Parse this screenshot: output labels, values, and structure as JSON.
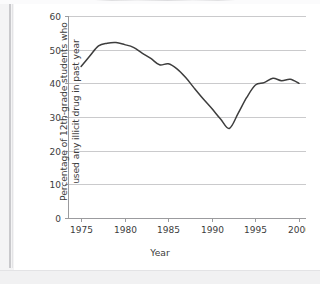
{
  "figure": {
    "kind": "line-chart",
    "background_color": "#ffffff",
    "page_edge_color": "#f4f4f5"
  },
  "axes": {
    "y_title": "Percentage of 12th-grade students who used any illicit drug in past year",
    "x_title": "Year",
    "y_ticks": [
      "0",
      "10",
      "20",
      "30",
      "40",
      "50",
      "60"
    ],
    "x_ticks": [
      "1975",
      "1980",
      "1985",
      "1990",
      "1995",
      "2000"
    ]
  },
  "chart_data": {
    "type": "line",
    "title": "",
    "subtitle": "",
    "xlabel": "Year",
    "ylabel": "Percentage of 12th-grade students who used any illicit drug in past year",
    "xlim": [
      1973.5,
      2000.8
    ],
    "ylim": [
      0,
      60
    ],
    "ytick_values": [
      0,
      10,
      20,
      30,
      40,
      50,
      60
    ],
    "xtick_values": [
      1975,
      1980,
      1985,
      1990,
      1995,
      2000
    ],
    "grid": "horizontal",
    "legend": "none",
    "line_color": "#3d3d3d",
    "line_width": 1.5,
    "markers": "none",
    "series": [
      {
        "name": "Used any illicit drug in past year",
        "x": [
          1975,
          1976,
          1977,
          1978,
          1979,
          1980,
          1981,
          1982,
          1983,
          1984,
          1985,
          1986,
          1987,
          1988,
          1989,
          1990,
          1991,
          1992,
          1993,
          1994,
          1995,
          1996,
          1997,
          1998,
          1999,
          2000
        ],
        "values": [
          45.0,
          48.1,
          51.1,
          51.9,
          52.1,
          51.5,
          50.7,
          49.0,
          47.4,
          45.5,
          45.8,
          44.3,
          41.7,
          38.5,
          35.4,
          32.5,
          29.4,
          26.6,
          31.0,
          35.8,
          39.5,
          40.2,
          41.5,
          40.8,
          41.2,
          40.0
        ]
      }
    ]
  }
}
